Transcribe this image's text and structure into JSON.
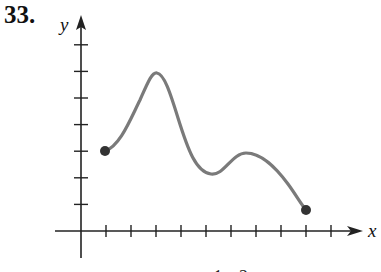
{
  "problem": {
    "number": "33."
  },
  "axes": {
    "x_label": "x",
    "y_label": "y",
    "origin_px": [
      81,
      231
    ],
    "unit_px": {
      "x": 25,
      "y": 26.6
    },
    "x_ticks": [
      1,
      2,
      3,
      4,
      5,
      6,
      7,
      8,
      9,
      10
    ],
    "y_ticks": [
      1,
      2,
      3,
      4,
      5,
      6,
      7
    ]
  },
  "colors": {
    "curve": "#7a7a7a",
    "endpoints": "#333333",
    "axes": "#222222"
  },
  "caption_fragment": "x   1  2",
  "chart_data": {
    "type": "line",
    "title": "33.",
    "xlabel": "x",
    "ylabel": "y",
    "xlim": [
      0,
      11
    ],
    "ylim": [
      -1,
      8
    ],
    "grid": false,
    "tick_labels": "none (unlabeled ticks at each unit)",
    "series": [
      {
        "name": "f(x)",
        "x": [
          1,
          1.5,
          2,
          2.5,
          3,
          3.5,
          4,
          4.5,
          5,
          5.5,
          6,
          6.5,
          7,
          7.5,
          8,
          8.5,
          9
        ],
        "values": [
          3,
          3.4,
          4.6,
          5.7,
          6.0,
          5.4,
          4.0,
          2.8,
          2.2,
          2.2,
          2.6,
          2.9,
          2.9,
          2.6,
          2.0,
          1.4,
          0.8
        ]
      }
    ],
    "endpoints": [
      {
        "x": 1,
        "y": 3,
        "closed": true
      },
      {
        "x": 9,
        "y": 0.8,
        "closed": true
      }
    ],
    "key_features": {
      "absolute_max": {
        "x": 3,
        "y": 6
      },
      "local_min": {
        "x": 5.2,
        "y": 2.1
      },
      "local_max": {
        "x": 6.6,
        "y": 2.9
      }
    }
  }
}
